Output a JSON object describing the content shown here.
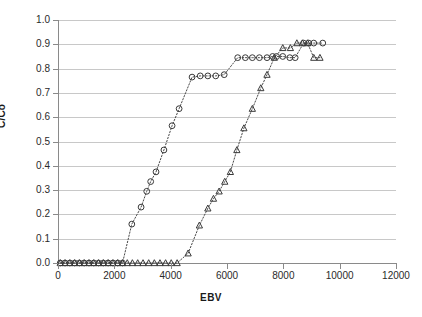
{
  "chart_data": {
    "type": "scatter",
    "title": "",
    "xlabel": "EBV",
    "ylabel": "C/Co",
    "xlim": [
      0,
      12000
    ],
    "ylim": [
      0.0,
      1.0
    ],
    "grid": true,
    "legend": "none",
    "x_ticks": [
      0,
      2000,
      4000,
      6000,
      8000,
      10000,
      12000
    ],
    "x_tick_labels": [
      "0",
      "2000",
      "4000",
      "6000",
      "8000",
      "10000",
      "12000"
    ],
    "y_ticks": [
      0.0,
      0.1,
      0.2,
      0.3,
      0.4,
      0.5,
      0.6,
      0.7,
      0.8,
      0.9,
      1.0
    ],
    "y_tick_labels": [
      "0.0",
      "0.1",
      "0.2",
      "0.3",
      "0.4",
      "0.5",
      "0.6",
      "0.7",
      "0.8",
      "0.9",
      "1.0"
    ],
    "series": [
      {
        "name": "series-circle",
        "marker": "open-circle",
        "line": "dotted",
        "color": "#3a3a3a",
        "points": [
          [
            80,
            0.0
          ],
          [
            250,
            0.0
          ],
          [
            420,
            0.0
          ],
          [
            590,
            0.0
          ],
          [
            760,
            0.0
          ],
          [
            930,
            0.0
          ],
          [
            1100,
            0.0
          ],
          [
            1270,
            0.0
          ],
          [
            1440,
            0.0
          ],
          [
            1610,
            0.0
          ],
          [
            1780,
            0.0
          ],
          [
            1950,
            0.0
          ],
          [
            2120,
            0.0
          ],
          [
            2290,
            0.0
          ],
          [
            2620,
            0.16
          ],
          [
            2950,
            0.23
          ],
          [
            3150,
            0.295
          ],
          [
            3290,
            0.335
          ],
          [
            3480,
            0.375
          ],
          [
            3760,
            0.465
          ],
          [
            4050,
            0.565
          ],
          [
            4300,
            0.635
          ],
          [
            4760,
            0.765
          ],
          [
            5050,
            0.77
          ],
          [
            5320,
            0.77
          ],
          [
            5600,
            0.77
          ],
          [
            5900,
            0.775
          ],
          [
            6380,
            0.845
          ],
          [
            6650,
            0.845
          ],
          [
            6900,
            0.845
          ],
          [
            7150,
            0.845
          ],
          [
            7420,
            0.845
          ],
          [
            7620,
            0.85
          ],
          [
            7760,
            0.85
          ],
          [
            7980,
            0.85
          ],
          [
            8230,
            0.845
          ],
          [
            8420,
            0.845
          ],
          [
            8720,
            0.905
          ],
          [
            8900,
            0.905
          ],
          [
            9080,
            0.905
          ],
          [
            9400,
            0.905
          ]
        ]
      },
      {
        "name": "series-triangle",
        "marker": "open-triangle",
        "line": "dotted",
        "color": "#3a3a3a",
        "points": [
          [
            80,
            0.0
          ],
          [
            250,
            0.0
          ],
          [
            420,
            0.0
          ],
          [
            590,
            0.0
          ],
          [
            760,
            0.0
          ],
          [
            930,
            0.0
          ],
          [
            1100,
            0.0
          ],
          [
            1270,
            0.0
          ],
          [
            1440,
            0.0
          ],
          [
            1610,
            0.0
          ],
          [
            1780,
            0.0
          ],
          [
            1950,
            0.0
          ],
          [
            2120,
            0.0
          ],
          [
            2290,
            0.0
          ],
          [
            2460,
            0.0
          ],
          [
            2640,
            0.0
          ],
          [
            2830,
            0.0
          ],
          [
            3020,
            0.0
          ],
          [
            3220,
            0.0
          ],
          [
            3420,
            0.0
          ],
          [
            3620,
            0.0
          ],
          [
            3820,
            0.0
          ],
          [
            4020,
            0.0
          ],
          [
            4230,
            0.0
          ],
          [
            4620,
            0.04
          ],
          [
            5020,
            0.155
          ],
          [
            5320,
            0.225
          ],
          [
            5520,
            0.265
          ],
          [
            5720,
            0.295
          ],
          [
            5920,
            0.335
          ],
          [
            6120,
            0.375
          ],
          [
            6350,
            0.465
          ],
          [
            6600,
            0.555
          ],
          [
            6900,
            0.635
          ],
          [
            7200,
            0.72
          ],
          [
            7420,
            0.775
          ],
          [
            7680,
            0.845
          ],
          [
            7980,
            0.885
          ],
          [
            8250,
            0.885
          ],
          [
            8480,
            0.905
          ],
          [
            8680,
            0.905
          ],
          [
            8860,
            0.905
          ],
          [
            9080,
            0.845
          ],
          [
            9300,
            0.845
          ]
        ]
      }
    ]
  },
  "axes": {
    "y_title": "C/Co",
    "x_title": "EBV"
  }
}
